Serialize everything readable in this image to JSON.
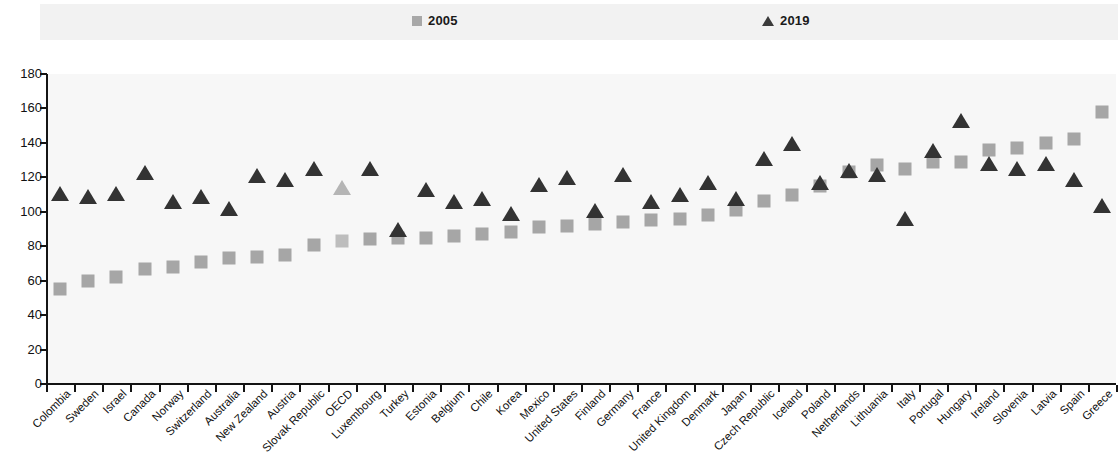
{
  "legend": {
    "series": [
      {
        "label": "2005",
        "marker": "square-marker",
        "color": "#a8a8a8"
      },
      {
        "label": "2019",
        "marker": "triangle-marker",
        "color": "#3b3b3b"
      }
    ]
  },
  "axis": {
    "y_ticks": [
      180,
      160,
      140,
      120,
      100,
      80,
      60,
      40,
      20,
      0
    ]
  },
  "chart_data": {
    "type": "scatter",
    "title": "",
    "subtitle": "",
    "xlabel": "",
    "ylabel": "",
    "ylim": [
      0,
      180
    ],
    "ytick_step": 20,
    "grid": false,
    "legend_position": "top",
    "highlight_category": "OECD",
    "categories": [
      "Colombia",
      "Sweden",
      "Israel",
      "Canada",
      "Norway",
      "Switzerland",
      "Australia",
      "New Zealand",
      "Austria",
      "Slovak Republic",
      "OECD",
      "Luxembourg",
      "Turkey",
      "Estonia",
      "Belgium",
      "Chile",
      "Korea",
      "Mexico",
      "United States",
      "Finland",
      "Germany",
      "France",
      "United Kingdom",
      "Denmark",
      "Japan",
      "Czech Republic",
      "Iceland",
      "Poland",
      "Netherlands",
      "Lithuania",
      "Italy",
      "Portugal",
      "Hungary",
      "Ireland",
      "Slovenia",
      "Latvia",
      "Spain",
      "Greece"
    ],
    "series": [
      {
        "name": "2005",
        "marker": "square",
        "color": "#a6a6a6",
        "values": [
          55,
          60,
          62,
          67,
          68,
          71,
          73,
          74,
          75,
          81,
          83,
          84,
          85,
          85,
          86,
          87,
          88,
          91,
          92,
          93,
          94,
          95,
          96,
          98,
          101,
          106,
          110,
          115,
          123,
          127,
          125,
          129,
          129,
          136,
          137,
          140,
          142,
          158
        ]
      },
      {
        "name": "2019",
        "marker": "triangle",
        "color": "#333333",
        "values": [
          110,
          108,
          110,
          122,
          105,
          108,
          101,
          120,
          118,
          124,
          113,
          124,
          89,
          112,
          105,
          107,
          98,
          115,
          119,
          100,
          121,
          105,
          109,
          116,
          107,
          130,
          139,
          116,
          123,
          121,
          95,
          135,
          152,
          127,
          124,
          127,
          118,
          103
        ]
      }
    ]
  }
}
